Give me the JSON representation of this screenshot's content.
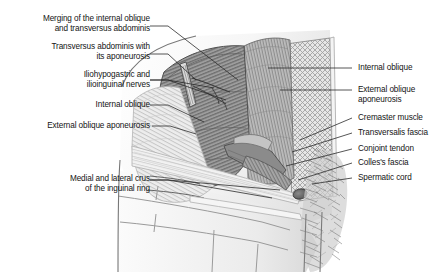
{
  "figure": {
    "palette": {
      "background": "#ffffff",
      "ink": "#141414",
      "leader_line": "#2b2b2b",
      "muscle_dark": "#6e6e6e",
      "muscle_mid": "#9a9a9a",
      "muscle_light": "#c9c9c9",
      "aponeurosis": "#e3e3e3",
      "fascia_pale": "#f0f0f0",
      "cord_hair": "#7d7d7d",
      "outline": "#555555"
    }
  },
  "labels_left": [
    {
      "id": "merging-internal-oblique-transversus",
      "lines": [
        "Merging of the internal oblique",
        "and transversus abdominis"
      ],
      "text": "Merging of the internal oblique\nand transversus abdominis"
    },
    {
      "id": "transversus-abdominis-aponeurosis",
      "lines": [
        "Transversus abdominis with",
        "its aponeurosis"
      ],
      "text": "Transversus abdominis with\nits aponeurosis"
    },
    {
      "id": "iliohypogastric-ilioinguinal-nerves",
      "lines": [
        "Iliohypogastric and",
        "ilioinguinal nerves"
      ],
      "text": "Iliohypogastric and\nilioinguinal nerves"
    },
    {
      "id": "internal-oblique",
      "lines": [
        "Internal oblique"
      ],
      "text": "Internal oblique"
    },
    {
      "id": "external-oblique-aponeurosis",
      "lines": [
        "External oblique aponeurosis"
      ],
      "text": "External oblique aponeurosis"
    },
    {
      "id": "medial-lateral-crus-inguinal-ring",
      "lines": [
        "Medial and lateral crus",
        "of the inguinal ring"
      ],
      "text": "Medial and lateral crus\nof the inguinal ring"
    }
  ],
  "labels_right": [
    {
      "id": "internal-oblique",
      "lines": [
        "Internal oblique"
      ],
      "text": "Internal oblique"
    },
    {
      "id": "external-oblique-aponeurosis",
      "lines": [
        "External oblique",
        "aponeurosis"
      ],
      "text": "External oblique\naponeurosis"
    },
    {
      "id": "cremaster-muscle",
      "lines": [
        "Cremaster muscle"
      ],
      "text": "Cremaster muscle"
    },
    {
      "id": "transversalis-fascia",
      "lines": [
        "Transversalis fascia"
      ],
      "text": "Transversalis fascia"
    },
    {
      "id": "conjoint-tendon",
      "lines": [
        "Conjoint tendon"
      ],
      "text": "Conjoint tendon"
    },
    {
      "id": "colles-fascia",
      "lines": [
        "Colles's fascia"
      ],
      "text": "Colles's fascia"
    },
    {
      "id": "spermatic-cord",
      "lines": [
        "Spermatic cord"
      ],
      "text": "Spermatic cord"
    }
  ]
}
